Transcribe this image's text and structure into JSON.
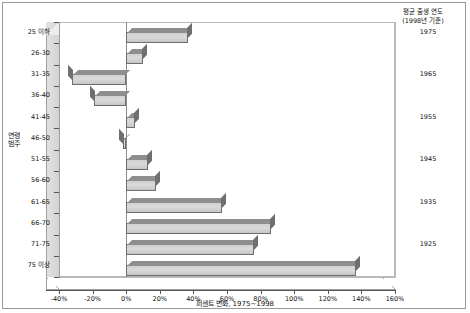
{
  "chart_data": {
    "type": "bar",
    "orientation": "horizontal",
    "title": "",
    "xlabel": "퍼센트 변화, 1975~1998",
    "ylabel": "연령 범주",
    "xlim": [
      -40,
      160
    ],
    "xtick_step": 20,
    "grid": false,
    "legend": "none",
    "categories": [
      "25 이하",
      "26-30",
      "31-35",
      "36-40",
      "41-45",
      "46-50",
      "51-55",
      "56-60",
      "61-65",
      "66-70",
      "71-75",
      "75 이상"
    ],
    "values": [
      37,
      10,
      -32,
      -19,
      5,
      -2,
      13,
      18,
      57,
      86,
      76,
      137
    ],
    "xticks": [
      "-40%",
      "-20%",
      "0%",
      "20%",
      "40%",
      "60%",
      "80%",
      "100%",
      "120%",
      "140%",
      "160%"
    ],
    "xtick_values": [
      -40,
      -20,
      0,
      20,
      40,
      60,
      80,
      100,
      120,
      140,
      160
    ],
    "annotations": {
      "right_column_title": "평균 출생 연도",
      "right_column_subtitle": "(1998년 기준)",
      "right_column_labels": [
        "1975",
        "1965",
        "1955",
        "1945",
        "1935",
        "1925"
      ],
      "right_column_rows": [
        0,
        2,
        4,
        6,
        8,
        10
      ]
    },
    "style": {
      "bar_fill": "#d4d4d4",
      "bar_edge": "#6e6e6e",
      "axis_color": "#555555",
      "frame_color": "#9a9a9a",
      "wall_color": "#dedede"
    }
  }
}
